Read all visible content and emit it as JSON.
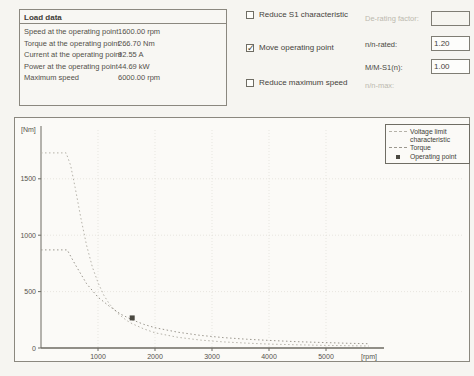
{
  "load_data": {
    "title": "Load data",
    "rows": [
      {
        "label": "Speed at the operating point",
        "value": "1600.00 rpm"
      },
      {
        "label": "Torque at the operating point",
        "value": "266.70 Nm"
      },
      {
        "label": "Current at the operating point",
        "value": "92.55 A"
      },
      {
        "label": "Power at the operating point",
        "value": "44.69 kW"
      },
      {
        "label": "Maximum speed",
        "value": "6000.00 rpm"
      }
    ]
  },
  "options": {
    "reduce_s1": {
      "label": "Reduce S1 characteristic",
      "checked": false,
      "field_label": "De-rating factor:",
      "field_value": ""
    },
    "move_op": {
      "label": "Move operating point",
      "checked": true,
      "fields": [
        {
          "label": "n/n-rated:",
          "value": "1.20"
        },
        {
          "label": "M/M-S1(n):",
          "value": "1.00"
        }
      ]
    },
    "reduce_max": {
      "label": "Reduce maximum speed",
      "checked": false,
      "field_label": "n/n-max:"
    }
  },
  "chart_data": {
    "type": "line",
    "xlabel": "[rpm]",
    "ylabel": "[Nm]",
    "xlim": [
      0,
      6000
    ],
    "ylim": [
      0,
      2000
    ],
    "x_ticks": [
      1000,
      2000,
      3000,
      4000,
      5000
    ],
    "y_ticks": [
      0,
      500,
      1000,
      1500
    ],
    "grid": true,
    "legend_position": "top-right",
    "legend": [
      {
        "label": "Voltage limit characteristic",
        "sample": "dashed-line",
        "series": "voltage_limit"
      },
      {
        "label": "Torque",
        "sample": "dashed-line",
        "series": "torque"
      },
      {
        "label": "Operating point",
        "sample": "square-marker"
      }
    ],
    "series": [
      {
        "name": "voltage_limit",
        "style": "dotted",
        "color": "#b5b2a9",
        "points": [
          [
            0,
            1730
          ],
          [
            440,
            1730
          ],
          [
            520,
            1620
          ],
          [
            600,
            1420
          ],
          [
            700,
            1150
          ],
          [
            800,
            910
          ],
          [
            900,
            720
          ],
          [
            1000,
            580
          ],
          [
            1100,
            470
          ],
          [
            1200,
            390
          ],
          [
            1350,
            305
          ],
          [
            1500,
            245
          ],
          [
            1600,
            215
          ],
          [
            1800,
            170
          ],
          [
            2000,
            135
          ],
          [
            2400,
            95
          ],
          [
            2800,
            70
          ],
          [
            3200,
            54
          ],
          [
            3600,
            43
          ],
          [
            4000,
            35
          ],
          [
            4500,
            28
          ],
          [
            5000,
            23
          ],
          [
            5400,
            20
          ],
          [
            5750,
            18
          ]
        ]
      },
      {
        "name": "torque",
        "style": "dotted",
        "color": "#9b978e",
        "points": [
          [
            0,
            870
          ],
          [
            460,
            870
          ],
          [
            600,
            740
          ],
          [
            800,
            570
          ],
          [
            1000,
            450
          ],
          [
            1200,
            370
          ],
          [
            1400,
            300
          ],
          [
            1600,
            250
          ],
          [
            1800,
            210
          ],
          [
            2000,
            180
          ],
          [
            2400,
            140
          ],
          [
            2800,
            112
          ],
          [
            3200,
            92
          ],
          [
            3600,
            78
          ],
          [
            4000,
            67
          ],
          [
            4500,
            56
          ],
          [
            5000,
            48
          ],
          [
            5400,
            42
          ],
          [
            5750,
            38
          ]
        ]
      }
    ],
    "operating_point": {
      "speed_rpm": 1600,
      "torque_nm": 266.7,
      "color": "#4a4841"
    }
  },
  "colors": {
    "axis": "#6c6a62",
    "grid": "#e0ddd5",
    "tick_text": "#55534b"
  }
}
